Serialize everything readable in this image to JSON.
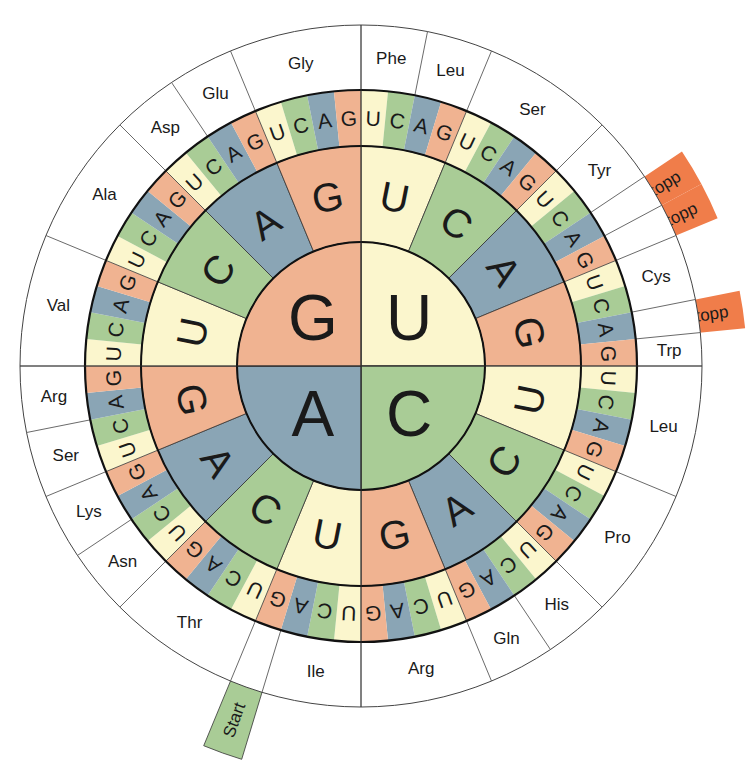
{
  "diagram": {
    "title": "",
    "type": "codon-wheel",
    "center": [
      361,
      366
    ],
    "radii": {
      "inner": 124,
      "ring2": 220,
      "ring3": 276,
      "outer": 341
    },
    "base_order_clockwise": [
      "U",
      "C",
      "A",
      "G"
    ],
    "base_colors": {
      "U": "#fbf6cd",
      "C": "#a9cc96",
      "A": "#8aa5b5",
      "G": "#f0b391"
    },
    "stop_color": "#f07d4a",
    "start_color": "#a9cc96",
    "first_base_ring": [
      {
        "base": "U",
        "quadrant": "top-right"
      },
      {
        "base": "C",
        "quadrant": "bottom-right"
      },
      {
        "base": "A",
        "quadrant": "bottom-left"
      },
      {
        "base": "G",
        "quadrant": "top-left"
      }
    ],
    "amino_acid_groups": [
      {
        "label": "Phe",
        "start": 0,
        "count": 2
      },
      {
        "label": "Leu",
        "start": 2,
        "count": 2
      },
      {
        "label": "Ser",
        "start": 4,
        "count": 4
      },
      {
        "label": "Tyr",
        "start": 8,
        "count": 2
      },
      {
        "label": "Stopp",
        "start": 10,
        "count": 1,
        "tab": "stop"
      },
      {
        "label": "Stopp",
        "start": 11,
        "count": 1,
        "tab": "stop"
      },
      {
        "label": "Cys",
        "start": 12,
        "count": 2
      },
      {
        "label": "Stopp",
        "start": 14,
        "count": 1,
        "tab": "stop"
      },
      {
        "label": "Trp",
        "start": 15,
        "count": 1
      },
      {
        "label": "Leu",
        "start": 16,
        "count": 4
      },
      {
        "label": "Pro",
        "start": 20,
        "count": 4
      },
      {
        "label": "His",
        "start": 24,
        "count": 2
      },
      {
        "label": "Gln",
        "start": 26,
        "count": 2
      },
      {
        "label": "Arg",
        "start": 28,
        "count": 4
      },
      {
        "label": "Ile",
        "start": 32,
        "count": 3
      },
      {
        "label": "Met",
        "start": 35,
        "count": 1,
        "tab": "start",
        "tab_label": "Start"
      },
      {
        "label": "Thr",
        "start": 36,
        "count": 4
      },
      {
        "label": "Asn",
        "start": 40,
        "count": 2
      },
      {
        "label": "Lys",
        "start": 42,
        "count": 2
      },
      {
        "label": "Ser",
        "start": 44,
        "count": 2
      },
      {
        "label": "Arg",
        "start": 46,
        "count": 2
      },
      {
        "label": "Val",
        "start": 48,
        "count": 4
      },
      {
        "label": "Ala",
        "start": 52,
        "count": 4
      },
      {
        "label": "Asp",
        "start": 56,
        "count": 2
      },
      {
        "label": "Glu",
        "start": 58,
        "count": 2
      },
      {
        "label": "Gly",
        "start": 60,
        "count": 4
      }
    ],
    "tab_labels": {
      "stop": "Stopp",
      "start": "Start"
    }
  }
}
